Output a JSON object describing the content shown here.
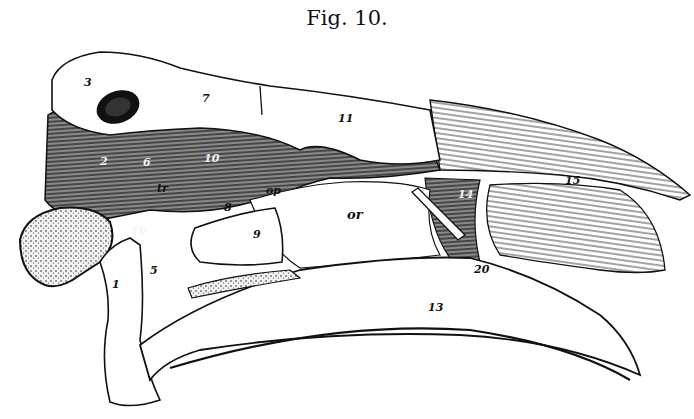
{
  "figure": {
    "caption": "Fig. 10.",
    "labels": [
      {
        "id": "l1",
        "text": "1"
      },
      {
        "id": "l2",
        "text": "2"
      },
      {
        "id": "l3",
        "text": "3"
      },
      {
        "id": "l5",
        "text": "5"
      },
      {
        "id": "l6",
        "text": "6"
      },
      {
        "id": "l7",
        "text": "7"
      },
      {
        "id": "l8",
        "text": "8"
      },
      {
        "id": "l9",
        "text": "9"
      },
      {
        "id": "l10",
        "text": "10"
      },
      {
        "id": "l11",
        "text": "11"
      },
      {
        "id": "l13",
        "text": "13"
      },
      {
        "id": "l14",
        "text": "14"
      },
      {
        "id": "l15",
        "text": "15"
      },
      {
        "id": "l16",
        "text": "16"
      },
      {
        "id": "l20",
        "text": "20"
      },
      {
        "id": "ltr",
        "text": "tr"
      },
      {
        "id": "lop",
        "text": "op"
      },
      {
        "id": "lor",
        "text": "or"
      }
    ]
  }
}
